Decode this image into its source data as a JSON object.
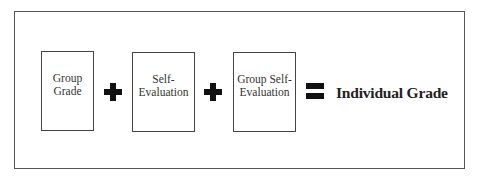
{
  "diagram": {
    "title": "",
    "components": [
      {
        "label_line1": "Group",
        "label_line2": "Grade"
      },
      {
        "label_line1": "Self-",
        "label_line2": "Evaluation"
      },
      {
        "label_line1": "Group Self-",
        "label_line2": "Evaluation"
      }
    ],
    "operators": [
      "plus",
      "plus",
      "equals"
    ],
    "result": "Individual Grade",
    "colors": {
      "border": "#444444",
      "operator": "#111111",
      "text": "#333333",
      "background": "#ffffff"
    }
  }
}
